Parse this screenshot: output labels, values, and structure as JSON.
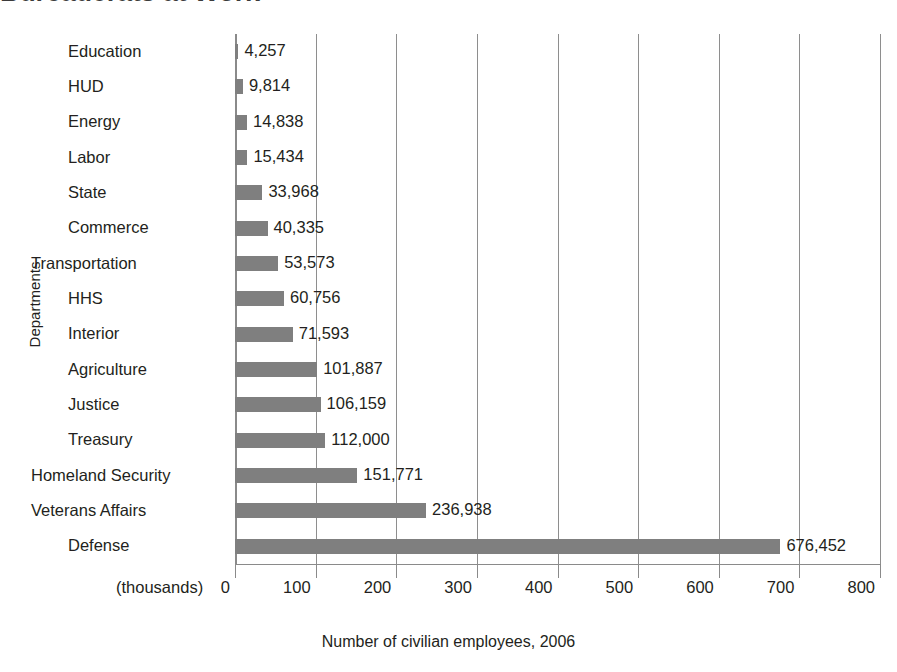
{
  "title": "Bureaucrats at Work",
  "axis": {
    "ylabel": "Departments",
    "xlabel": "Number of civilian employees, 2006",
    "thousands_note": "(thousands)"
  },
  "chart_data": {
    "type": "bar",
    "orientation": "horizontal",
    "title": "Bureaucrats at Work",
    "xlabel": "Number of civilian employees, 2006",
    "ylabel": "Departments",
    "unit_note": "(thousands)",
    "xlim": [
      0,
      800
    ],
    "xticks": [
      0,
      100,
      200,
      300,
      400,
      500,
      600,
      700,
      800
    ],
    "xtick_labels": [
      "0",
      "100",
      "200",
      "300",
      "400",
      "500",
      "600",
      "700",
      "800"
    ],
    "grid": true,
    "legend": false,
    "bar_color": "#7f7f7f",
    "categories": [
      "Education",
      "HUD",
      "Energy",
      "Labor",
      "State",
      "Commerce",
      "Transportation",
      "HHS",
      "Interior",
      "Agriculture",
      "Justice",
      "Treasury",
      "Homeland Security",
      "Veterans Affairs",
      "Defense"
    ],
    "values": [
      4257,
      9814,
      14838,
      15434,
      33968,
      40335,
      53573,
      60756,
      71593,
      101887,
      106159,
      112000,
      151771,
      236938,
      676452
    ],
    "value_labels": [
      "4,257",
      "9,814",
      "14,838",
      "15,434",
      "33,968",
      "40,335",
      "53,573",
      "60,756",
      "71,593",
      "101,887",
      "106,159",
      "112,000",
      "151,771",
      "236,938",
      "676,452"
    ]
  }
}
